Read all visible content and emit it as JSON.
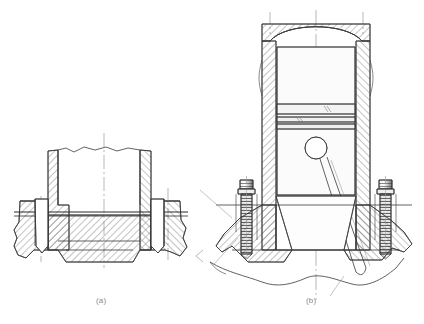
{
  "figure": {
    "background_color": "#ffffff",
    "line_color": "#3a3a3a",
    "hatch_color": "#555555",
    "centerline_color": "#9a9a9a",
    "caption_color": "#8a8a8a",
    "width": 424,
    "height": 324
  },
  "captions": {
    "a": "(a)",
    "b": "(b)"
  },
  "panels": [
    {
      "id": "panel-a",
      "label": "(a)",
      "name": "cylinder-liner-seat-section",
      "description": "Cross-section of a cylinder liner seating flange with bolt holes, shown with a break line at the top",
      "bounds": {
        "x": 10,
        "y": 130,
        "width": 185,
        "height": 140
      },
      "centerline_x": 104,
      "components": [
        {
          "name": "liner-wall-left",
          "type": "hatched-section"
        },
        {
          "name": "liner-wall-right",
          "type": "hatched-section"
        },
        {
          "name": "flange-left",
          "type": "hatched-section"
        },
        {
          "name": "flange-right",
          "type": "hatched-section"
        },
        {
          "name": "bolt-hole-left",
          "type": "bore"
        },
        {
          "name": "bolt-hole-right",
          "type": "bore"
        },
        {
          "name": "gasket-joint-line",
          "type": "joint"
        },
        {
          "name": "break-line-top",
          "type": "break"
        }
      ]
    },
    {
      "id": "panel-b",
      "label": "(b)",
      "name": "piston-cylinder-assembly-section",
      "description": "Cross-section of a piston inside a cylinder with domed crown, piston rings, gudgeon pin bore, connecting rod and two mounting studs",
      "bounds": {
        "x": 185,
        "y": 10,
        "width": 230,
        "height": 280
      },
      "centerline_x": 316,
      "components": [
        {
          "name": "cylinder-head-dome",
          "type": "hatched-section"
        },
        {
          "name": "cylinder-wall-left",
          "type": "hatched-section"
        },
        {
          "name": "cylinder-wall-right",
          "type": "hatched-section"
        },
        {
          "name": "piston-body",
          "type": "outline"
        },
        {
          "name": "piston-ring-upper",
          "type": "ring"
        },
        {
          "name": "piston-ring-middle",
          "type": "ring"
        },
        {
          "name": "piston-ring-lower",
          "type": "ring"
        },
        {
          "name": "gudgeon-pin-bore",
          "type": "circle"
        },
        {
          "name": "connecting-rod",
          "type": "outline"
        },
        {
          "name": "stud-left",
          "type": "threaded-fastener"
        },
        {
          "name": "stud-right",
          "type": "threaded-fastener"
        },
        {
          "name": "crankcase-flange-left",
          "type": "hatched-section"
        },
        {
          "name": "crankcase-flange-right",
          "type": "hatched-section"
        },
        {
          "name": "break-line-bottom",
          "type": "break"
        }
      ]
    }
  ]
}
